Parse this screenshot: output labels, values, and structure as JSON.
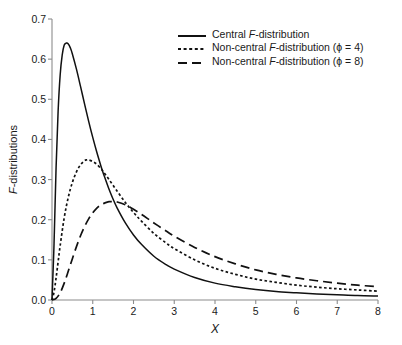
{
  "chart_data": {
    "type": "line",
    "title": "",
    "xlabel": "X",
    "ylabel": "F-distributions",
    "xlim": [
      0,
      8
    ],
    "ylim": [
      0.0,
      0.7
    ],
    "grid": false,
    "legend_position": "top-right",
    "xticks": [
      "0",
      "1",
      "2",
      "3",
      "4",
      "5",
      "6",
      "7",
      "8"
    ],
    "yticks": [
      "0.0",
      "0.1",
      "0.2",
      "0.3",
      "0.4",
      "0.5",
      "0.6",
      "0.7"
    ],
    "series": [
      {
        "name": "Central F-distribution",
        "style": "solid",
        "color": "#111111",
        "peak": {
          "x": 0.4,
          "y": 0.64
        },
        "x": [
          0.0,
          0.05,
          0.1,
          0.15,
          0.2,
          0.25,
          0.3,
          0.35,
          0.4,
          0.45,
          0.5,
          0.6,
          0.7,
          0.8,
          0.9,
          1.0,
          1.1,
          1.2,
          1.25,
          1.3,
          1.4,
          1.5,
          1.6,
          1.8,
          2.0,
          2.2,
          2.5,
          2.8,
          3.0,
          3.5,
          4.0,
          4.5,
          5.0,
          5.5,
          6.0,
          6.5,
          7.0,
          7.5,
          8.0
        ],
        "y": [
          0.0,
          0.14,
          0.33,
          0.47,
          0.56,
          0.61,
          0.635,
          0.64,
          0.638,
          0.628,
          0.613,
          0.575,
          0.532,
          0.488,
          0.445,
          0.405,
          0.368,
          0.334,
          0.318,
          0.304,
          0.276,
          0.251,
          0.229,
          0.192,
          0.162,
          0.138,
          0.109,
          0.088,
          0.077,
          0.056,
          0.042,
          0.033,
          0.026,
          0.021,
          0.018,
          0.015,
          0.013,
          0.011,
          0.01
        ]
      },
      {
        "name": "Non-central F-distribution (ϕ = 4)",
        "style": "dotted",
        "color": "#111111",
        "peak": {
          "x": 0.85,
          "y": 0.35
        },
        "x": [
          0.0,
          0.05,
          0.1,
          0.15,
          0.2,
          0.3,
          0.4,
          0.5,
          0.6,
          0.7,
          0.8,
          0.85,
          0.9,
          1.0,
          1.1,
          1.2,
          1.25,
          1.4,
          1.6,
          1.8,
          2.0,
          2.2,
          2.5,
          2.8,
          3.0,
          3.5,
          4.0,
          4.5,
          5.0,
          5.5,
          6.0,
          6.5,
          7.0,
          7.5,
          8.0
        ],
        "y": [
          0.0,
          0.02,
          0.055,
          0.095,
          0.135,
          0.205,
          0.256,
          0.293,
          0.319,
          0.337,
          0.347,
          0.349,
          0.349,
          0.345,
          0.338,
          0.327,
          0.321,
          0.3,
          0.271,
          0.243,
          0.218,
          0.196,
          0.166,
          0.142,
          0.128,
          0.1,
          0.079,
          0.064,
          0.052,
          0.044,
          0.037,
          0.032,
          0.028,
          0.025,
          0.022
        ]
      },
      {
        "name": "Non-central F-distribution (ϕ = 8)",
        "style": "dashed",
        "color": "#111111",
        "peak": {
          "x": 1.4,
          "y": 0.245
        },
        "x": [
          0.0,
          0.1,
          0.2,
          0.3,
          0.4,
          0.5,
          0.6,
          0.7,
          0.8,
          0.9,
          1.0,
          1.1,
          1.2,
          1.3,
          1.4,
          1.5,
          1.6,
          1.8,
          2.0,
          2.2,
          2.5,
          2.8,
          3.0,
          3.5,
          4.0,
          4.5,
          5.0,
          5.5,
          6.0,
          6.5,
          7.0,
          7.5,
          8.0
        ],
        "y": [
          0.0,
          0.004,
          0.018,
          0.042,
          0.072,
          0.103,
          0.133,
          0.16,
          0.183,
          0.202,
          0.217,
          0.229,
          0.237,
          0.242,
          0.245,
          0.245,
          0.244,
          0.237,
          0.226,
          0.213,
          0.192,
          0.172,
          0.159,
          0.131,
          0.108,
          0.09,
          0.075,
          0.064,
          0.055,
          0.048,
          0.042,
          0.037,
          0.033
        ]
      }
    ],
    "legend": [
      {
        "label_prefix": "Central ",
        "label_italic": "F",
        "label_suffix": "-distribution",
        "style": "solid"
      },
      {
        "label_prefix": "Non-central ",
        "label_italic": "F",
        "label_suffix": "-distribution (ϕ = 4)",
        "style": "dotted"
      },
      {
        "label_prefix": "Non-central ",
        "label_italic": "F",
        "label_suffix": "-distribution (ϕ = 8)",
        "style": "dashed"
      }
    ]
  },
  "axes": {
    "x_title_italic": "X",
    "y_title_italic": "F",
    "y_title_rest": "-distributions"
  }
}
